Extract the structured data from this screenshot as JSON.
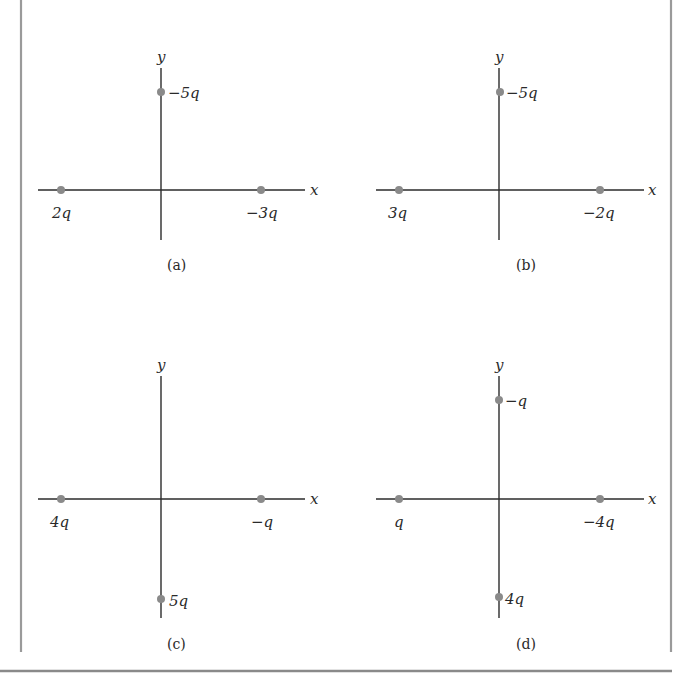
{
  "figure": {
    "border_color": "#9a9a9a",
    "axis_color": "#2b2b2b",
    "charge_color": "#8a8a8a",
    "panels": [
      {
        "id": "a",
        "caption": "(a)",
        "x_axis_label": "x",
        "y_axis_label": "y",
        "charges": [
          {
            "position": "left-x-axis",
            "label": "2q"
          },
          {
            "position": "right-x-axis",
            "label": "−3q"
          },
          {
            "position": "top-y-axis",
            "label": "−5q"
          }
        ]
      },
      {
        "id": "b",
        "caption": "(b)",
        "x_axis_label": "x",
        "y_axis_label": "y",
        "charges": [
          {
            "position": "left-x-axis",
            "label": "3q"
          },
          {
            "position": "right-x-axis",
            "label": "−2q"
          },
          {
            "position": "top-y-axis",
            "label": "−5q"
          }
        ]
      },
      {
        "id": "c",
        "caption": "(c)",
        "x_axis_label": "x",
        "y_axis_label": "y",
        "charges": [
          {
            "position": "left-x-axis",
            "label": "4q"
          },
          {
            "position": "right-x-axis",
            "label": "−q"
          },
          {
            "position": "bottom-y-axis",
            "label": "5q"
          }
        ]
      },
      {
        "id": "d",
        "caption": "(d)",
        "x_axis_label": "x",
        "y_axis_label": "y",
        "charges": [
          {
            "position": "left-x-axis",
            "label": "q"
          },
          {
            "position": "right-x-axis",
            "label": "−4q"
          },
          {
            "position": "top-y-axis",
            "label": "−q"
          },
          {
            "position": "bottom-y-axis",
            "label": "4q"
          }
        ]
      }
    ]
  }
}
